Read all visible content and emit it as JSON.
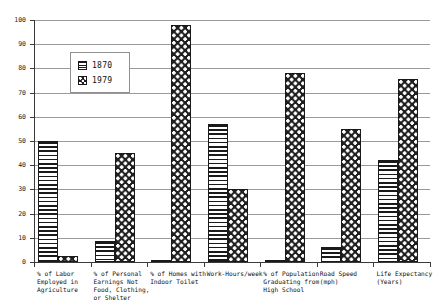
{
  "chart_data": {
    "type": "bar",
    "title": "",
    "subtitle": "",
    "xlabel": "",
    "ylabel": "",
    "ylim": [
      0,
      100
    ],
    "y_ticks": [
      0,
      10,
      20,
      30,
      40,
      50,
      60,
      70,
      80,
      90,
      100
    ],
    "grid": true,
    "legend_position": "upper-left-inside",
    "categories": [
      "% of Labor\nEmployed in\nAgriculture",
      "% of Personal\nEarnings Not\nFood, Clothing,\nor Shelter",
      "% of Homes with\nIndoor Toilet",
      "Work-Hours/week",
      "% of Population\nGraduating from\nHigh School",
      "Road Speed\n(mph)",
      "Life Expectancy\n(Years)"
    ],
    "series": [
      {
        "name": "1870",
        "pattern": "horizontal-stripes",
        "color": "#1a1a1a",
        "values": [
          50,
          8.5,
          1,
          57,
          1,
          6,
          42
        ]
      },
      {
        "name": "1979",
        "pattern": "checkered",
        "color": "#1f1f1f",
        "values": [
          2.5,
          45,
          98,
          30,
          78,
          55,
          75.5
        ]
      }
    ]
  },
  "legend": {
    "entries": [
      {
        "label": "1870",
        "swatch": "legend-swatch-1870"
      },
      {
        "label": "1979",
        "swatch": "legend-swatch-1979"
      }
    ]
  },
  "axis": {
    "y_tick_labels": [
      "0",
      "10",
      "20",
      "30",
      "40",
      "50",
      "60",
      "70",
      "80",
      "90",
      "100"
    ]
  }
}
